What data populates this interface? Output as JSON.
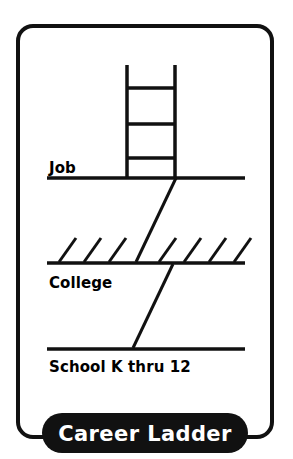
{
  "figure": {
    "title": "Career Ladder",
    "type": "career-ladder-diagram",
    "background_color": "#ffffff",
    "ink_color": "#111111",
    "banner_fill": "#111111",
    "banner_text_color": "#ffffff"
  },
  "frame": {
    "shape": "rounded-rectangle",
    "stroke_width_px": 4,
    "corner_radius_px": 15
  },
  "levels": [
    {
      "key": "job",
      "label": "Job",
      "label_position": "above-line",
      "order": 3
    },
    {
      "key": "college",
      "label": "College",
      "label_position": "below-line",
      "order": 2
    },
    {
      "key": "school",
      "label": "School K thru 12",
      "label_position": "below-line",
      "order": 1
    }
  ],
  "ladder": {
    "name": "ladder-graphic",
    "rails": 2,
    "rungs": 3,
    "position": "above-job-line"
  },
  "hatch_marks": {
    "name": "college-hatch-marks",
    "count": 7,
    "position": "above-college-line",
    "direction": "diagonal-up-right"
  },
  "connectors": [
    {
      "name": "school-to-college",
      "from": "school",
      "to": "college"
    },
    {
      "name": "college-to-job",
      "from": "college",
      "to": "job"
    }
  ],
  "banner": {
    "label": "Career Ladder",
    "shape": "pill"
  }
}
